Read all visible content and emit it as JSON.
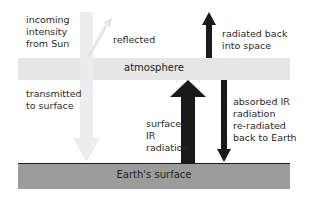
{
  "diagram": {
    "atmosphere_label": "atmosphere",
    "surface_label": "Earth's surface",
    "labels": {
      "incoming": [
        "incoming",
        "intensity",
        "from Sun"
      ],
      "reflected": "reflected",
      "transmitted": [
        "transmitted",
        "to surface"
      ],
      "surface_ir": [
        "surface",
        "IR",
        "radiation"
      ],
      "radiated_back": [
        "radiated back",
        "into space"
      ],
      "absorbed": [
        "absorbed IR",
        "radiation",
        "re-radiated",
        "back to Earth"
      ]
    },
    "arrows": [
      {
        "name": "incoming-sunlight",
        "direction": "down",
        "color": "#ececec"
      },
      {
        "name": "reflected-sunlight",
        "direction": "up-right",
        "color": "#ececec"
      },
      {
        "name": "surface-ir",
        "direction": "up",
        "color": "#1a1a1a"
      },
      {
        "name": "radiated-to-space",
        "direction": "up",
        "color": "#1a1a1a"
      },
      {
        "name": "re-radiated-to-earth",
        "direction": "down",
        "color": "#1a1a1a"
      }
    ],
    "colors": {
      "atmosphere": "#e6e6e6",
      "surface": "#9c9c9c",
      "dark_arrow": "#1a1a1a",
      "light_arrow": "#ececec"
    }
  }
}
